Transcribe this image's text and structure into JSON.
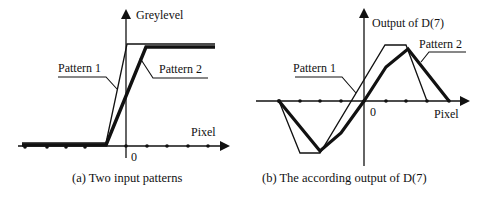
{
  "panel_a": {
    "y_axis_label": "Greylevel",
    "x_axis_label": "Pixel",
    "origin_label": "0",
    "pattern1_label": "Pattern 1",
    "pattern2_label": "Pattern 2",
    "caption": "(a) Two input patterns"
  },
  "panel_b": {
    "y_axis_label": "Output of D(7)",
    "x_axis_label": "Pixel",
    "origin_label": "0",
    "pattern1_label": "Pattern 1",
    "pattern2_label": "Pattern 2",
    "caption": "(b) The according output of D(7)"
  },
  "colors": {
    "line": "#111111",
    "background": "#ffffff"
  }
}
